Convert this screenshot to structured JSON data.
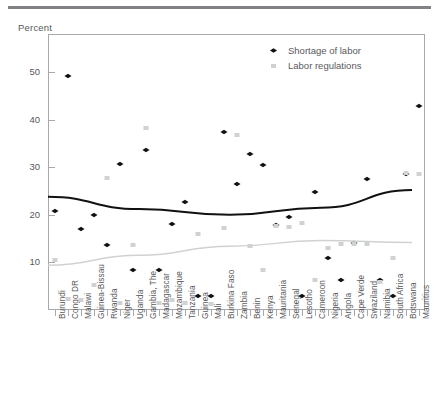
{
  "header": {
    "rule": "top-divider",
    "axis_unit": "Percent"
  },
  "legend": {
    "position": "top-right",
    "items": [
      {
        "label": "Shortage of labor",
        "marker": "diamond",
        "color": "#111111"
      },
      {
        "label": "Labor regulations",
        "marker": "square",
        "color": "#cfd1d3"
      }
    ]
  },
  "chart_data": {
    "type": "scatter",
    "title": "",
    "subtitle": "",
    "xlabel": "",
    "ylabel": "Percent",
    "ylim": [
      0,
      58
    ],
    "yticks": [
      10,
      20,
      30,
      40,
      50
    ],
    "grid": false,
    "legend_position": "top-right",
    "categories": [
      "Burundi",
      "Congo DR",
      "Malawi",
      "Guinea-Bissau",
      "Rwanda",
      "Niger",
      "Uganda",
      "Gambia, The",
      "Madagascar",
      "Mozambique",
      "Tanzania",
      "Guinea",
      "Mali",
      "Burkina Faso",
      "Zambia",
      "Benin",
      "Kenya",
      "Mauritania",
      "Senegal",
      "Lesotho",
      "Cameroon",
      "Nigeria",
      "Angola",
      "Cape Verde",
      "Swaziland",
      "Namibia",
      "South Africa",
      "Botswana",
      "Mauritius"
    ],
    "series": [
      {
        "name": "Shortage of labor",
        "marker": "diamond",
        "color": "#111111",
        "values": [
          20.8,
          49.1,
          17.0,
          20.0,
          13.6,
          30.6,
          8.5,
          33.7,
          8.4,
          18.0,
          22.6,
          3.0,
          3.0,
          37.4,
          26.5,
          32.8,
          30.4,
          17.8,
          19.5,
          3.0,
          24.7,
          11.0,
          6.3,
          14.0,
          27.6,
          6.4,
          3.0,
          28.5,
          42.9
        ]
      },
      {
        "name": "Labor regulations",
        "marker": "square",
        "color": "#cfd1d3",
        "values": [
          10.5,
          2.4,
          2.0,
          5.2,
          27.8,
          1.5,
          13.6,
          38.3,
          1.5,
          2.0,
          1.5,
          16.0,
          1.2,
          17.3,
          36.7,
          13.4,
          8.5,
          17.6,
          17.5,
          18.2,
          6.3,
          13.0,
          13.8,
          13.9,
          13.9,
          5.8,
          11.0,
          28.8,
          28.5
        ]
      }
    ],
    "trend_lines": [
      {
        "name": "Shortage of labor trend",
        "color": "#111111",
        "type": "quadratic",
        "points": [
          [
            0,
            23.8
          ],
          [
            7,
            21.2
          ],
          [
            14,
            20.0
          ],
          [
            21,
            21.5
          ],
          [
            28,
            25.2
          ]
        ]
      },
      {
        "name": "Labor regulations trend",
        "color": "#cfd1d3",
        "type": "quadratic",
        "points": [
          [
            0,
            9.4
          ],
          [
            7,
            11.5
          ],
          [
            14,
            13.4
          ],
          [
            21,
            14.6
          ],
          [
            28,
            14.2
          ]
        ]
      }
    ]
  }
}
